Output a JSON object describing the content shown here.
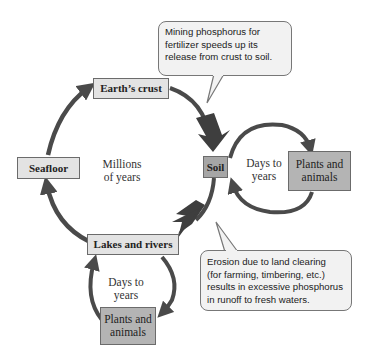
{
  "diagram": {
    "type": "cycle",
    "title": "",
    "nodes": {
      "earths_crust": "Earth’s crust",
      "seafloor": "Seafloor",
      "soil": "Soil",
      "lakes_and_rivers": "Lakes and rivers",
      "plants_animals_soil": [
        "Plants and",
        "animals"
      ],
      "plants_animals_lakes": [
        "Plants and",
        "animals"
      ]
    },
    "timescales": {
      "main_cycle": [
        "Millions",
        "of years"
      ],
      "soil_cycle": [
        "Days to",
        "years"
      ],
      "lakes_cycle": [
        "Days to",
        "years"
      ]
    },
    "callouts": {
      "mining": [
        "Mining phosphorus for",
        "fertilizer speeds up its",
        "release from crust to soil."
      ],
      "erosion": [
        "Erosion due to land clearing",
        "(for farming, timbering, etc.)",
        "results in excessive phosphorus",
        "in runoff to fresh waters."
      ]
    },
    "edges": [
      {
        "from": "Earth’s crust",
        "to": "Soil",
        "emphasis": "thick"
      },
      {
        "from": "Soil",
        "to": "Lakes and rivers",
        "emphasis": "thick"
      },
      {
        "from": "Lakes and rivers",
        "to": "Seafloor"
      },
      {
        "from": "Seafloor",
        "to": "Earth’s crust"
      },
      {
        "from": "Soil",
        "to": "Plants and animals"
      },
      {
        "from": "Plants and animals",
        "to": "Soil"
      },
      {
        "from": "Lakes and rivers",
        "to": "Plants and animals"
      },
      {
        "from": "Plants and animals",
        "to": "Lakes and rivers"
      }
    ],
    "colors": {
      "arrow": "#4a4a4a",
      "box_light": "#e3e3e3",
      "box_dark": "#a6a6a6",
      "callout_bg": "#f2f2f2"
    }
  }
}
